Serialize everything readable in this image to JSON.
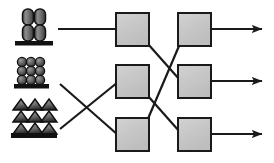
{
  "diagram": {
    "type": "node-link-diagram",
    "canvas": {
      "width": 274,
      "height": 163,
      "background": "#ffffff"
    },
    "style": {
      "box_fill": "#c4c4c4",
      "box_fill_highlight": "#d6d6d6",
      "box_stroke": "#1a1a1a",
      "box_stroke_width": 2,
      "line_color": "#1a1a1a",
      "line_width": 2.2,
      "icon_dark": "#1a1a1a",
      "icon_mid": "#707070",
      "icon_light": "#b5b5b5",
      "base_color": "#111111"
    },
    "sources": [
      {
        "id": "source-1",
        "name": "capsule-stack-icon",
        "label": "",
        "shape": "capsules-2x2-on-base",
        "x": 18,
        "y": 8,
        "width": 30,
        "height": 38,
        "rows": 2,
        "cols": 2
      },
      {
        "id": "source-2",
        "name": "sphere-grid-icon",
        "label": "",
        "shape": "spheres-3x3-on-base",
        "x": 15,
        "y": 57,
        "width": 34,
        "height": 32,
        "rows": 3,
        "cols": 3
      },
      {
        "id": "source-3",
        "name": "triangle-stack-icon",
        "label": "",
        "shape": "triangles-3rows-on-base",
        "x": 12,
        "y": 100,
        "width": 42,
        "height": 38,
        "rows": 3,
        "cols": 3
      }
    ],
    "stage_one_nodes": [
      {
        "id": "box-a1",
        "name": "stage1-node-top",
        "label": "",
        "x": 116,
        "y": 13,
        "width": 33,
        "height": 33
      },
      {
        "id": "box-a2",
        "name": "stage1-node-middle",
        "label": "",
        "x": 116,
        "y": 65,
        "width": 33,
        "height": 33
      },
      {
        "id": "box-a3",
        "name": "stage1-node-bottom",
        "label": "",
        "x": 116,
        "y": 118,
        "width": 33,
        "height": 33
      }
    ],
    "stage_two_nodes": [
      {
        "id": "box-b1",
        "name": "stage2-node-top",
        "label": "",
        "x": 178,
        "y": 13,
        "width": 33,
        "height": 33
      },
      {
        "id": "box-b2",
        "name": "stage2-node-middle",
        "label": "",
        "x": 178,
        "y": 65,
        "width": 33,
        "height": 33
      },
      {
        "id": "box-b3",
        "name": "stage2-node-bottom",
        "label": "",
        "x": 178,
        "y": 118,
        "width": 33,
        "height": 33
      }
    ],
    "input_edges": [
      {
        "id": "edge-in-1",
        "name": "edge-source1-to-stage1-top",
        "from": "source-1",
        "to": "box-a1",
        "x1": 58,
        "y1": 29,
        "x2": 116,
        "y2": 29,
        "crosses": false
      },
      {
        "id": "edge-in-2",
        "name": "edge-source2-to-stage1-bottom",
        "from": "source-2",
        "to": "box-a3",
        "x1": 60,
        "y1": 84,
        "x2": 116,
        "y2": 134,
        "crosses": true
      },
      {
        "id": "edge-in-3",
        "name": "edge-source3-to-stage1-middle",
        "from": "source-3",
        "to": "box-a2",
        "x1": 60,
        "y1": 129,
        "x2": 116,
        "y2": 82,
        "crosses": true
      }
    ],
    "middle_edges": [
      {
        "id": "edge-mid-1",
        "name": "edge-stage1-top-to-stage2-middle",
        "from": "box-a1",
        "to": "box-b2",
        "x1": 149,
        "y1": 44,
        "x2": 178,
        "y2": 78,
        "crosses": true
      },
      {
        "id": "edge-mid-2",
        "name": "edge-stage1-middle-to-stage2-bottom",
        "from": "box-a2",
        "to": "box-b3",
        "x1": 149,
        "y1": 96,
        "x2": 178,
        "y2": 130,
        "crosses": true
      },
      {
        "id": "edge-mid-3",
        "name": "edge-stage1-bottom-to-stage2-top",
        "from": "box-a3",
        "to": "box-b1",
        "x1": 149,
        "y1": 120,
        "x2": 178,
        "y2": 46,
        "crosses": true
      }
    ],
    "output_edges": [
      {
        "id": "edge-out-1",
        "name": "output-arrow-top",
        "from": "box-b1",
        "x1": 211,
        "y1": 29,
        "x2": 262,
        "y2": 29,
        "arrowhead": true
      },
      {
        "id": "edge-out-2",
        "name": "output-arrow-middle",
        "from": "box-b2",
        "x1": 211,
        "y1": 81,
        "x2": 262,
        "y2": 81,
        "arrowhead": true
      },
      {
        "id": "edge-out-3",
        "name": "output-arrow-bottom",
        "from": "box-b3",
        "x1": 211,
        "y1": 134,
        "x2": 262,
        "y2": 134,
        "arrowhead": true
      }
    ]
  }
}
